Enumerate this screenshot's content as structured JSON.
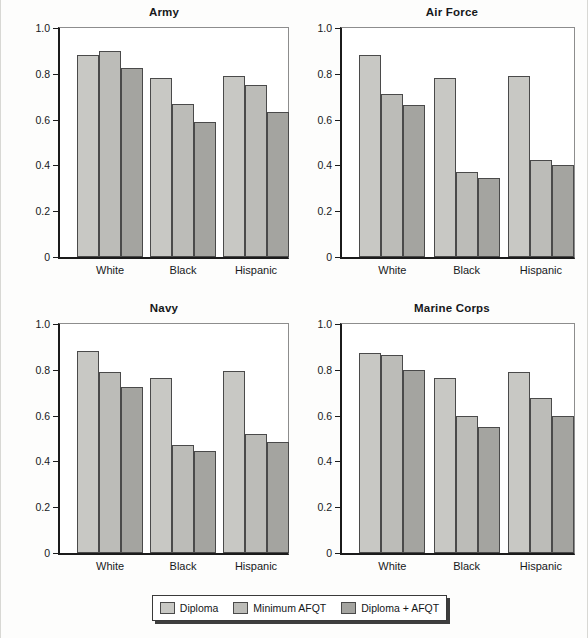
{
  "figure": {
    "background": "#fdfdfc",
    "ylabel": "Fraction passing",
    "y_ticks": [
      "1.0",
      "0.8",
      "0.6",
      "0.4",
      "0.2",
      "0"
    ],
    "categories": [
      "White",
      "Black",
      "Hispanic"
    ]
  },
  "legend": {
    "position": "bottom-center",
    "items": [
      {
        "label": "Diploma",
        "color": "#c8c8c4"
      },
      {
        "label": "Minimum AFQT",
        "color": "#bcbcb8"
      },
      {
        "label": "Diploma + AFQT",
        "color": "#a4a4a0"
      }
    ]
  },
  "chart_data": [
    {
      "type": "bar",
      "title": "Army",
      "xlabel": "",
      "ylabel": "Fraction passing",
      "categories": [
        "White",
        "Black",
        "Hispanic"
      ],
      "ylim": [
        0,
        1.0
      ],
      "yticks": [
        0,
        0.2,
        0.4,
        0.6,
        0.8,
        1.0
      ],
      "grid": false,
      "legend_position": "figure-bottom",
      "series": [
        {
          "name": "Diploma",
          "color": "#c8c8c4",
          "values": [
            0.88,
            0.78,
            0.79
          ]
        },
        {
          "name": "Minimum AFQT",
          "color": "#bcbcb8",
          "values": [
            0.9,
            0.67,
            0.75
          ]
        },
        {
          "name": "Diploma + AFQT",
          "color": "#a4a4a0",
          "values": [
            0.825,
            0.59,
            0.635
          ]
        }
      ]
    },
    {
      "type": "bar",
      "title": "Air Force",
      "xlabel": "",
      "ylabel": "",
      "categories": [
        "White",
        "Black",
        "Hispanic"
      ],
      "ylim": [
        0,
        1.0
      ],
      "yticks": [
        0,
        0.2,
        0.4,
        0.6,
        0.8,
        1.0
      ],
      "grid": false,
      "legend_position": "figure-bottom",
      "series": [
        {
          "name": "Diploma",
          "color": "#c8c8c4",
          "values": [
            0.88,
            0.78,
            0.79
          ]
        },
        {
          "name": "Minimum AFQT",
          "color": "#bcbcb8",
          "values": [
            0.71,
            0.37,
            0.425
          ]
        },
        {
          "name": "Diploma + AFQT",
          "color": "#a4a4a0",
          "values": [
            0.665,
            0.345,
            0.4
          ]
        }
      ]
    },
    {
      "type": "bar",
      "title": "Navy",
      "xlabel": "",
      "ylabel": "Fraction passing",
      "categories": [
        "White",
        "Black",
        "Hispanic"
      ],
      "ylim": [
        0,
        1.0
      ],
      "yticks": [
        0,
        0.2,
        0.4,
        0.6,
        0.8,
        1.0
      ],
      "grid": false,
      "legend_position": "figure-bottom",
      "series": [
        {
          "name": "Diploma",
          "color": "#c8c8c4",
          "values": [
            0.88,
            0.765,
            0.795
          ]
        },
        {
          "name": "Minimum AFQT",
          "color": "#bcbcb8",
          "values": [
            0.79,
            0.47,
            0.52
          ]
        },
        {
          "name": "Diploma + AFQT",
          "color": "#a4a4a0",
          "values": [
            0.725,
            0.445,
            0.485
          ]
        }
      ]
    },
    {
      "type": "bar",
      "title": "Marine Corps",
      "xlabel": "",
      "ylabel": "",
      "categories": [
        "White",
        "Black",
        "Hispanic"
      ],
      "ylim": [
        0,
        1.0
      ],
      "yticks": [
        0,
        0.2,
        0.4,
        0.6,
        0.8,
        1.0
      ],
      "grid": false,
      "legend_position": "figure-bottom",
      "series": [
        {
          "name": "Diploma",
          "color": "#c8c8c4",
          "values": [
            0.875,
            0.765,
            0.79
          ]
        },
        {
          "name": "Minimum AFQT",
          "color": "#bcbcb8",
          "values": [
            0.865,
            0.6,
            0.675
          ]
        },
        {
          "name": "Diploma + AFQT",
          "color": "#a4a4a0",
          "values": [
            0.8,
            0.55,
            0.6
          ]
        }
      ]
    }
  ]
}
